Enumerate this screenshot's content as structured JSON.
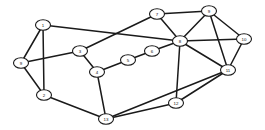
{
  "diagram": {
    "type": "undirected-graph",
    "node_count": 13,
    "edge_count": 24,
    "style": {
      "node_fill": "#ffffff",
      "node_stroke": "#1a1a1a",
      "edge_color": "#1a1a1a",
      "background": "#ffffff",
      "node_rx": 7.5,
      "node_ry": 5.2,
      "edge_width": 1.5
    },
    "nodes": [
      {
        "id": "1",
        "label": "1",
        "x": 43,
        "y": 25
      },
      {
        "id": "2",
        "label": "2",
        "x": 44,
        "y": 95
      },
      {
        "id": "3",
        "label": "3",
        "x": 80,
        "y": 51
      },
      {
        "id": "4",
        "label": "4",
        "x": 97,
        "y": 72
      },
      {
        "id": "5",
        "label": "5",
        "x": 128,
        "y": 60
      },
      {
        "id": "6",
        "label": "6",
        "x": 152,
        "y": 51
      },
      {
        "id": "7",
        "label": "7",
        "x": 157,
        "y": 14
      },
      {
        "id": "8",
        "label": "8",
        "x": 180,
        "y": 41
      },
      {
        "id": "9",
        "label": "9",
        "x": 209,
        "y": 11
      },
      {
        "id": "10",
        "label": "10",
        "x": 244,
        "y": 39
      },
      {
        "id": "11",
        "label": "11",
        "x": 228,
        "y": 70
      },
      {
        "id": "12",
        "label": "12",
        "x": 176,
        "y": 103
      },
      {
        "id": "13",
        "label": "13",
        "x": 106,
        "y": 119
      },
      {
        "id": "14",
        "label": "9",
        "x": 21,
        "y": 63
      }
    ],
    "edges": [
      {
        "source": "1",
        "target": "14"
      },
      {
        "source": "1",
        "target": "2"
      },
      {
        "source": "1",
        "target": "8"
      },
      {
        "source": "14",
        "target": "2"
      },
      {
        "source": "14",
        "target": "3"
      },
      {
        "source": "2",
        "target": "13"
      },
      {
        "source": "3",
        "target": "4"
      },
      {
        "source": "3",
        "target": "7"
      },
      {
        "source": "4",
        "target": "5"
      },
      {
        "source": "4",
        "target": "13"
      },
      {
        "source": "5",
        "target": "6"
      },
      {
        "source": "6",
        "target": "8"
      },
      {
        "source": "7",
        "target": "9"
      },
      {
        "source": "7",
        "target": "8"
      },
      {
        "source": "9",
        "target": "8"
      },
      {
        "source": "9",
        "target": "10"
      },
      {
        "source": "9",
        "target": "11"
      },
      {
        "source": "8",
        "target": "10"
      },
      {
        "source": "8",
        "target": "11"
      },
      {
        "source": "8",
        "target": "12"
      },
      {
        "source": "10",
        "target": "11"
      },
      {
        "source": "11",
        "target": "13"
      },
      {
        "source": "12",
        "target": "13"
      },
      {
        "source": "12",
        "target": "11"
      }
    ]
  }
}
